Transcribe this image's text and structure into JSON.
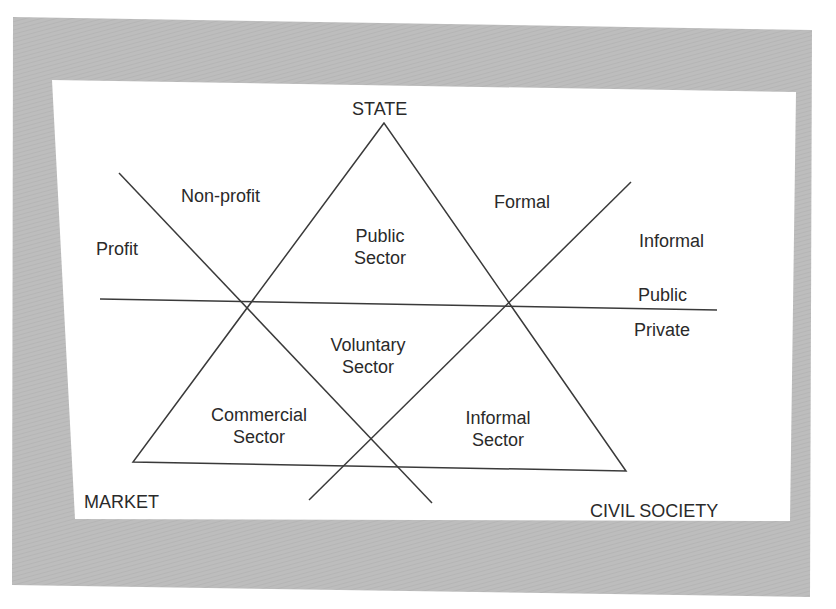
{
  "colors": {
    "mat": "#bdbdbd",
    "panel": "#ffffff",
    "line": "#3a3a3a",
    "text": "#2a2a2a"
  },
  "vertices": {
    "top": "STATE",
    "bottom_left": "MARKET",
    "bottom_right": "CIVIL SOCIETY"
  },
  "axis_labels": {
    "profit": "Profit",
    "non_profit": "Non-profit",
    "formal": "Formal",
    "informal": "Informal",
    "public": "Public",
    "private": "Private"
  },
  "sectors": {
    "public": {
      "line1": "Public",
      "line2": "Sector"
    },
    "voluntary": {
      "line1": "Voluntary",
      "line2": "Sector"
    },
    "commercial": {
      "line1": "Commercial",
      "line2": "Sector"
    },
    "informal": {
      "line1": "Informal",
      "line2": "Sector"
    }
  }
}
